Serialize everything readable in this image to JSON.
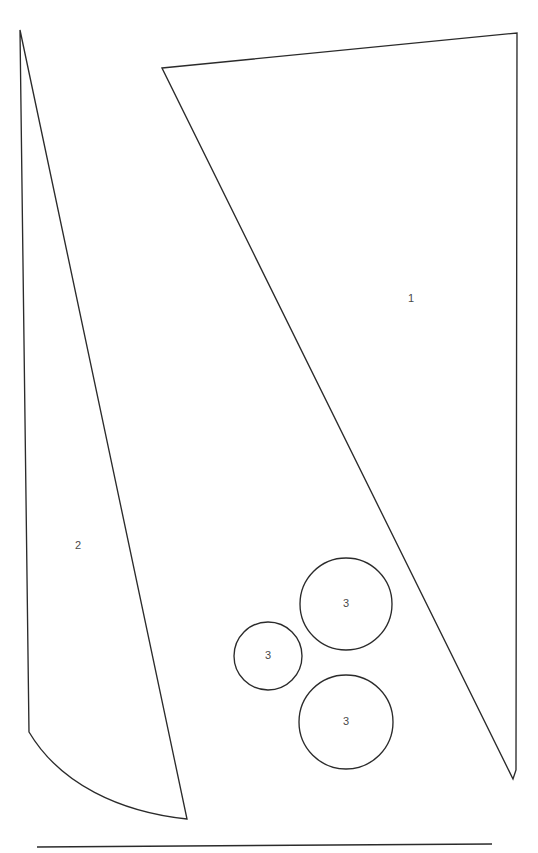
{
  "canvas": {
    "width": 538,
    "height": 853,
    "background_color": "#ffffff",
    "stroke_color": "#2b2b2b",
    "label_color": "#4a4a4a"
  },
  "chart_data": {
    "type": "diagram",
    "title": "",
    "regions": [
      {
        "label": "1",
        "shape": "polygon",
        "label_position": {
          "x": 411,
          "y": 299
        },
        "vertices": [
          {
            "x": 162,
            "y": 68
          },
          {
            "x": 517,
            "y": 33
          },
          {
            "x": 516,
            "y": 770
          },
          {
            "x": 513,
            "y": 779
          }
        ],
        "path": "M162,68 L517,33 L516,770 L513,779 Z"
      },
      {
        "label": "2",
        "shape": "polygon-with-curved-base",
        "label_position": {
          "x": 78,
          "y": 546
        },
        "vertices": [
          {
            "x": 20,
            "y": 30
          },
          {
            "x": 29,
            "y": 732
          },
          {
            "x": 187,
            "y": 819
          }
        ],
        "path": "M20,30 L29,732 C60,784 120,812 187,819 Z"
      }
    ],
    "circles": [
      {
        "label": "3",
        "cx": 268,
        "cy": 656,
        "r": 34
      },
      {
        "label": "3",
        "cx": 346,
        "cy": 604,
        "r": 46
      },
      {
        "label": "3",
        "cx": 346,
        "cy": 722,
        "r": 47
      }
    ],
    "baseline": {
      "x1": 37,
      "y1": 847,
      "x2": 492,
      "y2": 844
    }
  }
}
